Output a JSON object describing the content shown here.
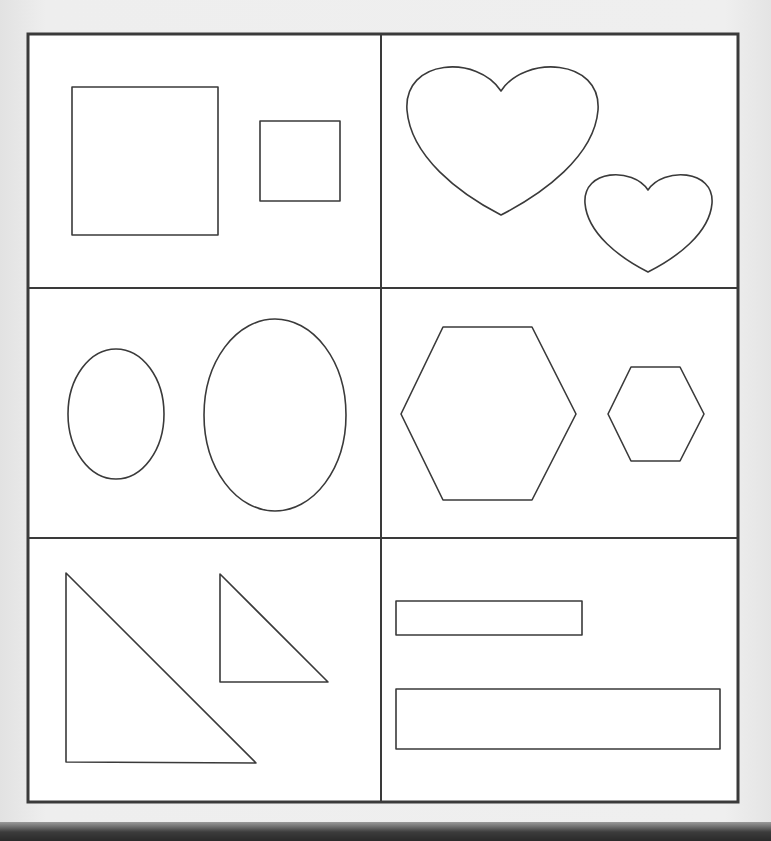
{
  "page": {
    "background": "#efefef",
    "paper": "#ffffff",
    "line_color": "#3a3a3a",
    "top_text_visible": false
  },
  "grid": {
    "frame": {
      "x": 28,
      "y": 34,
      "width": 710,
      "height": 768,
      "stroke_width": 3
    },
    "columns_divider_x": 381,
    "row_dividers_y": [
      288,
      538
    ],
    "cells": [
      {
        "id": "squares",
        "label": "squares",
        "shapes": [
          {
            "type": "rect",
            "size": "large",
            "x": 72,
            "y": 87,
            "width": 146,
            "height": 148
          },
          {
            "type": "rect",
            "size": "small",
            "x": 260,
            "y": 121,
            "width": 80,
            "height": 80
          }
        ]
      },
      {
        "id": "hearts",
        "label": "hearts",
        "shapes": [
          {
            "type": "heart",
            "size": "large",
            "cx": 501,
            "top": 61,
            "notch_y": 91,
            "tip_y": 215,
            "left": 407,
            "right": 598
          },
          {
            "type": "heart",
            "size": "small",
            "cx": 648,
            "top": 171,
            "notch_y": 190,
            "tip_y": 272,
            "left": 585,
            "right": 712
          }
        ]
      },
      {
        "id": "ovals",
        "label": "ovals",
        "shapes": [
          {
            "type": "ellipse",
            "size": "small",
            "cx": 116,
            "cy": 414,
            "rx": 48,
            "ry": 65
          },
          {
            "type": "ellipse",
            "size": "large",
            "cx": 275,
            "cy": 415,
            "rx": 71,
            "ry": 96
          }
        ]
      },
      {
        "id": "hexagons",
        "label": "hexagons",
        "shapes": [
          {
            "type": "hexagon",
            "size": "large",
            "points": "443,327 532,327 576,414 532,500 443,500 401,414"
          },
          {
            "type": "hexagon",
            "size": "small",
            "points": "631,367 680,367 704,414 680,461 631,461 608,414"
          }
        ]
      },
      {
        "id": "triangles",
        "label": "right triangles",
        "shapes": [
          {
            "type": "triangle",
            "size": "large",
            "points": "66,573 66,762 256,763"
          },
          {
            "type": "triangle",
            "size": "small",
            "points": "220,574 220,682 328,682"
          }
        ]
      },
      {
        "id": "rectangles",
        "label": "rectangles",
        "shapes": [
          {
            "type": "rect",
            "size": "short",
            "x": 396,
            "y": 601,
            "width": 186,
            "height": 34
          },
          {
            "type": "rect",
            "size": "long",
            "x": 396,
            "y": 689,
            "width": 324,
            "height": 60
          }
        ]
      }
    ]
  }
}
